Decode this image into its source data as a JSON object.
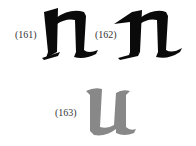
{
  "figures": [
    {
      "label": "(161)",
      "letter": "n",
      "color": "#0a0a0a"
    },
    {
      "label": "(162)",
      "letter": "n",
      "color": "#0a0a0a"
    },
    {
      "label": "(163)",
      "letter": "u",
      "color": "#888888"
    }
  ]
}
